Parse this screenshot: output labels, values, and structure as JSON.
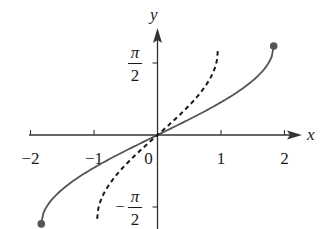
{
  "chart_data": {
    "type": "line",
    "title": "",
    "xlabel": "x",
    "ylabel": "y",
    "xlim": [
      -2.1,
      2.3
    ],
    "ylim": [
      -2.0,
      2.5
    ],
    "x_ticks": [
      {
        "value": -2,
        "label": "−2"
      },
      {
        "value": -1,
        "label": "−1"
      },
      {
        "value": 0,
        "label": "0"
      },
      {
        "value": 1,
        "label": "1"
      },
      {
        "value": 2,
        "label": "2"
      }
    ],
    "y_ticks": [
      {
        "value": 1.5708,
        "label_num": "π",
        "label_den": "2",
        "sign": ""
      },
      {
        "value": -1.5708,
        "label_num": "π",
        "label_den": "2",
        "sign": "−"
      }
    ],
    "grid": false,
    "legend": null,
    "series": [
      {
        "name": "solid curve",
        "style": "solid",
        "color": "#555555",
        "x_endpoints": [
          -1.83,
          1.83
        ],
        "y_endpoints": [
          -1.94,
          1.94
        ],
        "endpoint_markers": true,
        "x": [
          -1.83,
          -1.6,
          -1.2,
          -0.8,
          -0.4,
          0,
          0.4,
          0.8,
          1.2,
          1.6,
          1.83
        ],
        "y": [
          -1.94,
          -1.02,
          -0.65,
          -0.42,
          -0.2,
          0,
          0.2,
          0.42,
          0.65,
          1.02,
          1.94
        ]
      },
      {
        "name": "dashed curve",
        "style": "dashed",
        "color": "#1a1a1a",
        "x_endpoints": [
          -0.95,
          0.95
        ],
        "y_endpoints": [
          -1.83,
          1.83
        ],
        "endpoint_markers": false,
        "x": [
          -0.95,
          -0.8,
          -0.6,
          -0.4,
          -0.2,
          0,
          0.2,
          0.4,
          0.6,
          0.8,
          0.95
        ],
        "y": [
          -1.83,
          -1.05,
          -0.7,
          -0.45,
          -0.22,
          0,
          0.22,
          0.45,
          0.7,
          1.05,
          1.83
        ]
      }
    ]
  }
}
